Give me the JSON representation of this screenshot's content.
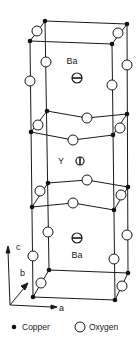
{
  "diagram": {
    "title": "",
    "atoms": {
      "ba_upper": {
        "label": "Ba"
      },
      "y_center": {
        "label": "Y"
      },
      "ba_lower": {
        "label": "Ba"
      }
    },
    "axes": {
      "a": "a",
      "b": "b",
      "c": "c"
    },
    "legend": {
      "copper": "Copper",
      "oxygen": "Oxygen"
    },
    "colors": {
      "line": "#1a1a1a",
      "copper_fill": "#111111",
      "oxygen_fill": "#ffffff"
    }
  }
}
